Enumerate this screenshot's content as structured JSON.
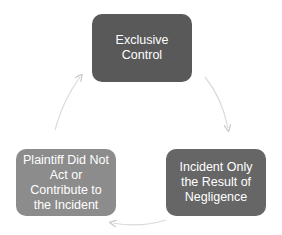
{
  "diagram": {
    "type": "cycle",
    "nodes": [
      {
        "id": "top",
        "label": "Exclusive Control",
        "color": "#595959"
      },
      {
        "id": "right",
        "label": "Incident Only the Result of Negligence",
        "color": "#666666"
      },
      {
        "id": "left",
        "label": "Plaintiff Did Not Act or Contribute to the Incident",
        "color": "#8c8c8c"
      }
    ],
    "edges": [
      {
        "from": "top",
        "to": "right"
      },
      {
        "from": "right",
        "to": "left"
      },
      {
        "from": "left",
        "to": "top"
      }
    ],
    "arrow_color": "#d9d9d9"
  }
}
